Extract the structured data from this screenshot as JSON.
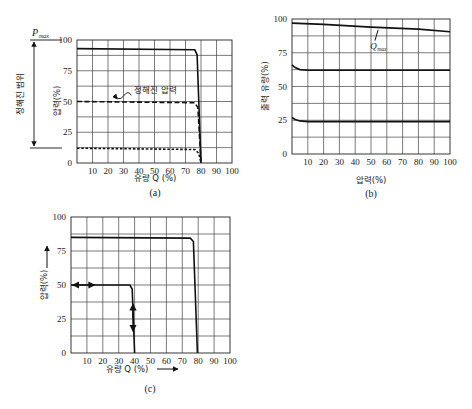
{
  "chart_data": [
    {
      "id": "a",
      "type": "line",
      "caption": "(a)",
      "title": "",
      "xlabel": "유량 Q (%)",
      "ylabel": "압력(%)",
      "side_label": "정해진 범위",
      "side_top_label": "P_max",
      "annotation": "정해진 압력",
      "xlim": [
        0,
        100
      ],
      "ylim": [
        0,
        100
      ],
      "xticks": [
        10,
        20,
        30,
        40,
        50,
        60,
        70,
        80,
        90,
        100
      ],
      "yticks": [
        0,
        25,
        50,
        75,
        100
      ],
      "grid": {
        "x_step": 10,
        "y_step": 12.5
      },
      "series": [
        {
          "name": "max pressure",
          "style": "solid",
          "points": [
            [
              0,
              93
            ],
            [
              76,
              92
            ],
            [
              77.5,
              88
            ],
            [
              80,
              0
            ]
          ]
        },
        {
          "name": "set pressure 50%",
          "style": "dashed",
          "points": [
            [
              0,
              50
            ],
            [
              76,
              49
            ],
            [
              78,
              45
            ],
            [
              80,
              0
            ]
          ]
        },
        {
          "name": "set pressure 12%",
          "style": "dotted",
          "points": [
            [
              0,
              12
            ],
            [
              76,
              11
            ],
            [
              78.5,
              8
            ],
            [
              80,
              0
            ]
          ]
        }
      ]
    },
    {
      "id": "b",
      "type": "line",
      "caption": "(b)",
      "title": "",
      "xlabel": "압력(%)",
      "ylabel": "출력 유량(%)",
      "annotation": "Q_max",
      "xlim": [
        0,
        100
      ],
      "ylim": [
        0,
        100
      ],
      "xticks": [
        10,
        20,
        30,
        40,
        50,
        60,
        70,
        80,
        90,
        100
      ],
      "yticks": [
        0,
        25,
        50,
        75,
        100
      ],
      "grid": {
        "x_step": 10,
        "y_step": 12.5
      },
      "series": [
        {
          "name": "Q_max",
          "style": "solid",
          "points": [
            [
              0,
              97
            ],
            [
              20,
              96
            ],
            [
              50,
              94
            ],
            [
              80,
              92.5
            ],
            [
              100,
              90.5
            ]
          ]
        },
        {
          "name": "flow 62%",
          "style": "solid",
          "points": [
            [
              0,
              66
            ],
            [
              2,
              64
            ],
            [
              5,
              62.5
            ],
            [
              10,
              62
            ],
            [
              100,
              62
            ]
          ]
        },
        {
          "name": "flow 24%",
          "style": "solid",
          "points": [
            [
              0,
              27
            ],
            [
              2,
              25.5
            ],
            [
              5,
              24.5
            ],
            [
              10,
              24
            ],
            [
              100,
              24
            ]
          ]
        }
      ]
    },
    {
      "id": "c",
      "type": "line",
      "caption": "(c)",
      "title": "",
      "xlabel": "유량 Q (%)",
      "ylabel": "압력(%)",
      "xlim": [
        0,
        100
      ],
      "ylim": [
        0,
        100
      ],
      "xticks": [
        10,
        20,
        30,
        40,
        50,
        60,
        70,
        80,
        90,
        100
      ],
      "yticks": [
        0,
        25,
        50,
        75,
        100
      ],
      "grid": {
        "x_step": 10,
        "y_step": 12.5
      },
      "series": [
        {
          "name": "max pressure",
          "style": "solid",
          "points": [
            [
              0,
              85
            ],
            [
              75,
              84.5
            ],
            [
              77,
              82
            ],
            [
              79.5,
              0
            ]
          ]
        },
        {
          "name": "adjustable 50%",
          "style": "solid",
          "points": [
            [
              0,
              50
            ],
            [
              37,
              50
            ],
            [
              38.5,
              47
            ],
            [
              40,
              0
            ]
          ]
        }
      ],
      "arrows": [
        "horizontal double arrow at 50% (Q≈5-15)",
        "vertical double arrow at Q≈39 (P≈25-35)"
      ]
    }
  ]
}
